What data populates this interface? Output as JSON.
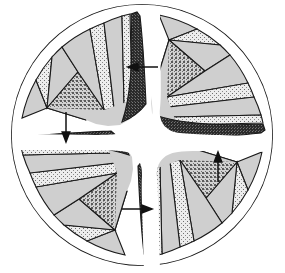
{
  "figure": {
    "title": "Pinwheel tiling diagram",
    "type": "rotational-symmetry-fan-diagram",
    "background_color": "#ffffff",
    "outline_color": "#1a1a1a",
    "center": {
      "x": 142,
      "y": 135
    },
    "radius": 131,
    "rotational_symmetry_order": 4,
    "arm_count": 4,
    "tiles_per_arm": 8,
    "shading_classes": [
      {
        "name": "plain-light-gray",
        "label": "plain light gray",
        "color": "#cfcfcf",
        "texture": "solid"
      },
      {
        "name": "fine-light-stipple",
        "label": "fine light stipple",
        "color": "#e2e2e2",
        "texture": "sparse-dots"
      },
      {
        "name": "medium-stipple",
        "label": "medium coarse stipple",
        "color": "#b0b0b0",
        "texture": "coarse-dots"
      },
      {
        "name": "dense-dark-hatch",
        "label": "dense dark crosshatch",
        "color": "#3a3a3a",
        "texture": "crosshatch"
      }
    ],
    "arms": [
      {
        "name": "arm-top-left",
        "label": "Top-left arm",
        "rotation_deg": 0,
        "dark_wedge_position": "leading-edge"
      },
      {
        "name": "arm-top-right",
        "label": "Top-right arm",
        "rotation_deg": 90,
        "dark_wedge_position": "leading-edge"
      },
      {
        "name": "arm-bottom-right",
        "label": "Bottom-right arm",
        "rotation_deg": 180,
        "dark_wedge_position": "leading-edge"
      },
      {
        "name": "arm-bottom-left",
        "label": "Bottom-left arm",
        "rotation_deg": 270,
        "dark_wedge_position": "leading-edge"
      }
    ],
    "arrows": [
      {
        "name": "arrow-top",
        "label": "top arrow",
        "direction": "left",
        "x": 158,
        "y": 67,
        "length": 26
      },
      {
        "name": "arrow-left",
        "label": "left arrow",
        "direction": "down",
        "x": 66,
        "y": 122,
        "length": 26
      },
      {
        "name": "arrow-bottom",
        "label": "bottom arrow",
        "direction": "right",
        "x": 126,
        "y": 209,
        "length": 26
      },
      {
        "name": "arrow-right",
        "label": "right arrow",
        "direction": "up",
        "x": 218,
        "y": 176,
        "length": 26
      }
    ]
  }
}
